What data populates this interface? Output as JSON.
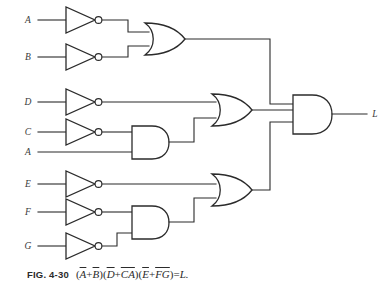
{
  "figure": {
    "label": "FIG. 4-30",
    "expression_plain": "(Ā + B̄)(D̄ + C̄Ā)(Ē + F̄Ḡ) = L.",
    "output_label": "L",
    "terms": {
      "t1_a": "A",
      "t1_plus": "+",
      "t1_b": "B",
      "t2_d": "D",
      "t2_plus": "+",
      "t2_ca": "CA",
      "t3_e": "E",
      "t3_plus": "+",
      "t3_fg": "FG",
      "equals": "=",
      "result": "L.",
      "open": "(",
      "close_open": ")(",
      "close": ")"
    }
  },
  "inputs": [
    {
      "name": "input-a-top",
      "label": "A",
      "x": 28,
      "y": 20
    },
    {
      "name": "input-b",
      "label": "B",
      "x": 28,
      "y": 57
    },
    {
      "name": "input-d",
      "label": "D",
      "x": 28,
      "y": 102
    },
    {
      "name": "input-c",
      "label": "C",
      "x": 28,
      "y": 132
    },
    {
      "name": "input-a-second",
      "label": "A",
      "x": 28,
      "y": 152
    },
    {
      "name": "input-e",
      "label": "E",
      "x": 28,
      "y": 184
    },
    {
      "name": "input-f",
      "label": "F",
      "x": 28,
      "y": 212
    },
    {
      "name": "input-g",
      "label": "G",
      "x": 28,
      "y": 246
    }
  ],
  "inverters": [
    {
      "name": "inverter-a-top",
      "input": "A",
      "x": 66,
      "y": 20
    },
    {
      "name": "inverter-b",
      "input": "B",
      "x": 66,
      "y": 57
    },
    {
      "name": "inverter-d",
      "input": "D",
      "x": 66,
      "y": 102
    },
    {
      "name": "inverter-c",
      "input": "C",
      "x": 66,
      "y": 132
    },
    {
      "name": "inverter-e",
      "input": "E",
      "x": 66,
      "y": 184
    },
    {
      "name": "inverter-f",
      "input": "F",
      "x": 66,
      "y": 212
    },
    {
      "name": "inverter-g",
      "input": "G",
      "x": 66,
      "y": 246
    }
  ],
  "and_gates": [
    {
      "name": "and-gate-ca",
      "x": 132,
      "y": 142,
      "inputs": [
        "C-inverted",
        "A"
      ]
    },
    {
      "name": "and-gate-fg",
      "x": 132,
      "y": 222,
      "inputs": [
        "F-inverted",
        "G-inverted"
      ]
    },
    {
      "name": "and-gate-output",
      "x": 293,
      "y": 113,
      "inputs": [
        "OR-AB",
        "OR-D-CA",
        "OR-E-FG"
      ],
      "output": "L"
    }
  ],
  "or_gates": [
    {
      "name": "or-gate-ab",
      "x": 145,
      "y": 39,
      "inputs": [
        "A-inverted",
        "B-inverted"
      ]
    },
    {
      "name": "or-gate-d-ca",
      "x": 212,
      "y": 110,
      "inputs": [
        "D-inverted",
        "AND-CA"
      ]
    },
    {
      "name": "or-gate-e-fg",
      "x": 212,
      "y": 190,
      "inputs": [
        "E-inverted",
        "AND-FG"
      ]
    }
  ],
  "colors": {
    "ink": "#2b2b2b",
    "background": "#ffffff",
    "label_ink": "#3a3a3a"
  }
}
